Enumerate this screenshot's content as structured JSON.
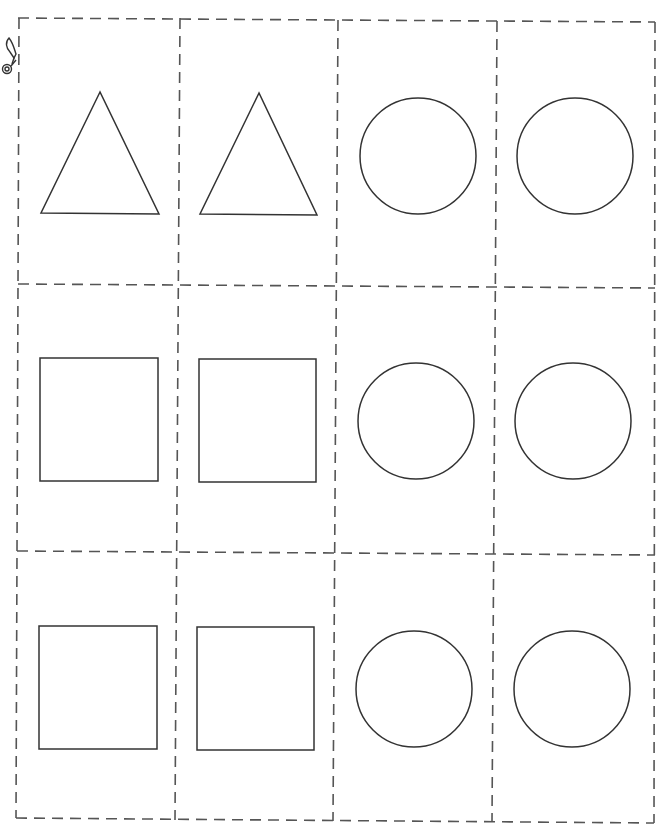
{
  "worksheet": {
    "type": "cut-out shape cards",
    "grid": {
      "columns": 4,
      "rows": 3
    },
    "line_color": "#555555",
    "shape_stroke_color": "#333333",
    "cut_line_style": "dashed",
    "scissors_icon": "scissors-icon",
    "cards": [
      {
        "row": 1,
        "col": 1,
        "shape": "triangle"
      },
      {
        "row": 1,
        "col": 2,
        "shape": "triangle"
      },
      {
        "row": 1,
        "col": 3,
        "shape": "circle"
      },
      {
        "row": 1,
        "col": 4,
        "shape": "circle"
      },
      {
        "row": 2,
        "col": 1,
        "shape": "square"
      },
      {
        "row": 2,
        "col": 2,
        "shape": "square"
      },
      {
        "row": 2,
        "col": 3,
        "shape": "circle"
      },
      {
        "row": 2,
        "col": 4,
        "shape": "circle"
      },
      {
        "row": 3,
        "col": 1,
        "shape": "square"
      },
      {
        "row": 3,
        "col": 2,
        "shape": "square"
      },
      {
        "row": 3,
        "col": 3,
        "shape": "circle"
      },
      {
        "row": 3,
        "col": 4,
        "shape": "circle"
      }
    ]
  }
}
